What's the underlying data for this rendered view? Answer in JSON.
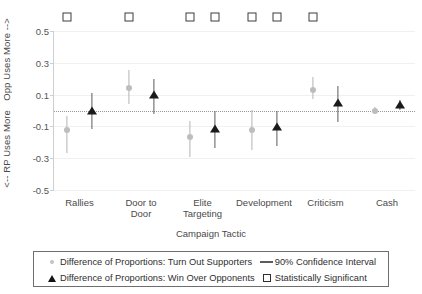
{
  "chart_data": {
    "type": "scatter",
    "title": "",
    "xlabel": "Campaign Tactic",
    "ylabel_top": "Opp Uses More -->",
    "ylabel_bottom": "<-- RP Uses More",
    "ylim": [
      -0.5,
      0.5
    ],
    "yticks": [
      "0.5",
      "0.3",
      "0.1",
      "-0.1",
      "-0.3",
      "-0.5"
    ],
    "ytick_values": [
      0.5,
      0.3,
      0.1,
      -0.1,
      -0.3,
      -0.5
    ],
    "grid": true,
    "zero_reference_line": 0,
    "legend_position": "below-plot",
    "categories": [
      "Rallies",
      "Door to\nDoor",
      "Elite\nTargeting",
      "Development",
      "Criticism",
      "Cash"
    ],
    "series": [
      {
        "name": "Difference of Proportions: Turn Out Supporters",
        "marker": "circle",
        "color": "#bdbdbd",
        "values": [
          -0.125,
          0.14,
          -0.165,
          -0.12,
          0.13,
          0.0
        ],
        "ci_low": [
          -0.27,
          0.04,
          -0.29,
          -0.25,
          0.075,
          -0.02
        ],
        "ci_high": [
          -0.035,
          0.255,
          -0.065,
          0.005,
          0.21,
          0.02
        ]
      },
      {
        "name": "Difference of Proportions: Win Over Opponents",
        "marker": "triangle",
        "color": "#1a1a1a",
        "values": [
          0.0,
          0.095,
          -0.115,
          -0.105,
          0.045,
          0.035
        ],
        "ci_low": [
          -0.115,
          -0.02,
          -0.235,
          -0.225,
          -0.07,
          0.005
        ],
        "ci_high": [
          0.11,
          0.2,
          -0.005,
          0.0,
          0.155,
          0.065
        ]
      }
    ],
    "significance_markers": {
      "label": "Statistically Significant",
      "y_position": 0.6,
      "marks": [
        {
          "category": "Rallies",
          "series": "Turn Out Supporters",
          "significant": true
        },
        {
          "category": "Door to Door",
          "series": "Turn Out Supporters",
          "significant": true
        },
        {
          "category": "Elite Targeting",
          "series": "Turn Out Supporters",
          "significant": true
        },
        {
          "category": "Elite Targeting",
          "series": "Win Over Opponents",
          "significant": true
        },
        {
          "category": "Development",
          "series": "Turn Out Supporters",
          "significant": true
        },
        {
          "category": "Development",
          "series": "Win Over Opponents",
          "significant": true
        },
        {
          "category": "Criticism",
          "series": "Turn Out Supporters",
          "significant": true
        }
      ]
    },
    "legend": [
      {
        "icon": "circle-marker-icon",
        "label": "Difference of Proportions: Turn Out Supporters"
      },
      {
        "icon": "line-segment-icon",
        "label": "90% Confidence Interval"
      },
      {
        "icon": "triangle-marker-icon",
        "label": "Difference of Proportions: Win Over Opponents"
      },
      {
        "icon": "open-square-icon",
        "label": "Statistically Significant"
      }
    ]
  }
}
